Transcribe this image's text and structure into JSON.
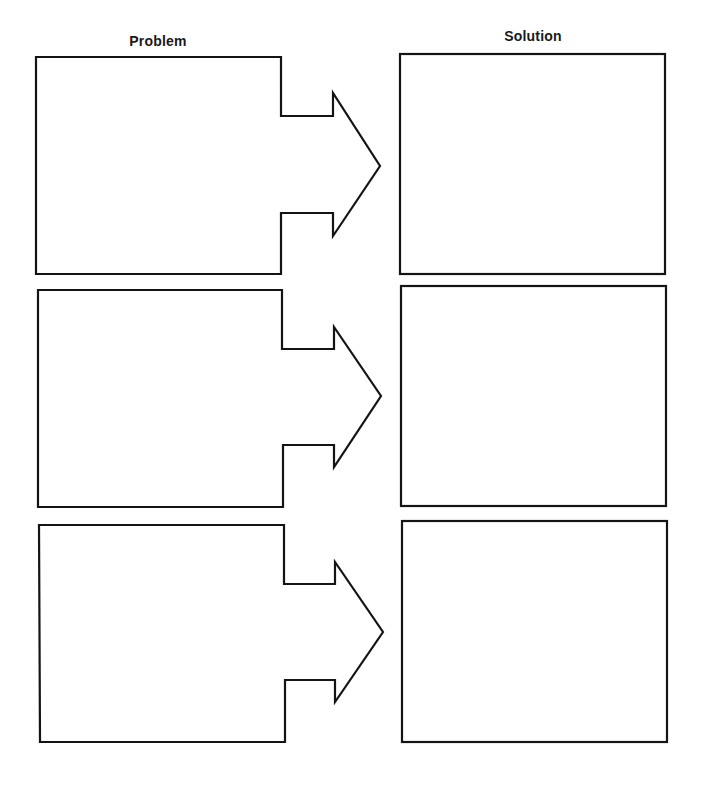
{
  "worksheet": {
    "columns": {
      "left_title": "Problem",
      "right_title": "Solution"
    },
    "rows": [
      {
        "problem_text": "",
        "solution_text": ""
      },
      {
        "problem_text": "",
        "solution_text": ""
      },
      {
        "problem_text": "",
        "solution_text": ""
      }
    ],
    "colors": {
      "stroke": "#141414",
      "background": "#ffffff",
      "text": "#1a1a1a"
    }
  }
}
